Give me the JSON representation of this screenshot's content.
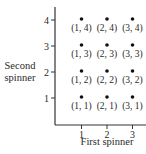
{
  "chart_data": {
    "type": "scatter",
    "title": "",
    "xlabel": "First spinner",
    "ylabel": "Second spinner",
    "ylabel_lines": [
      "Second",
      "spinner"
    ],
    "x_ticks": [
      "1",
      "2",
      "3"
    ],
    "y_ticks": [
      "1",
      "2",
      "3",
      "4"
    ],
    "xlim": [
      0,
      3.6
    ],
    "ylim": [
      0,
      4.5
    ],
    "grid": false,
    "legend": null,
    "points": [
      {
        "x": 1,
        "y": 1,
        "label": "(1, 1)"
      },
      {
        "x": 2,
        "y": 1,
        "label": "(2, 1)"
      },
      {
        "x": 3,
        "y": 1,
        "label": "(3, 1)"
      },
      {
        "x": 1,
        "y": 2,
        "label": "(1, 2)"
      },
      {
        "x": 2,
        "y": 2,
        "label": "(2, 2)"
      },
      {
        "x": 3,
        "y": 2,
        "label": "(3, 2)"
      },
      {
        "x": 1,
        "y": 3,
        "label": "(1, 3)"
      },
      {
        "x": 2,
        "y": 3,
        "label": "(2, 3)"
      },
      {
        "x": 3,
        "y": 3,
        "label": "(3, 3)"
      },
      {
        "x": 1,
        "y": 4,
        "label": "(1, 4)"
      },
      {
        "x": 2,
        "y": 4,
        "label": "(2, 4)"
      },
      {
        "x": 3,
        "y": 4,
        "label": "(3, 4)"
      }
    ]
  }
}
